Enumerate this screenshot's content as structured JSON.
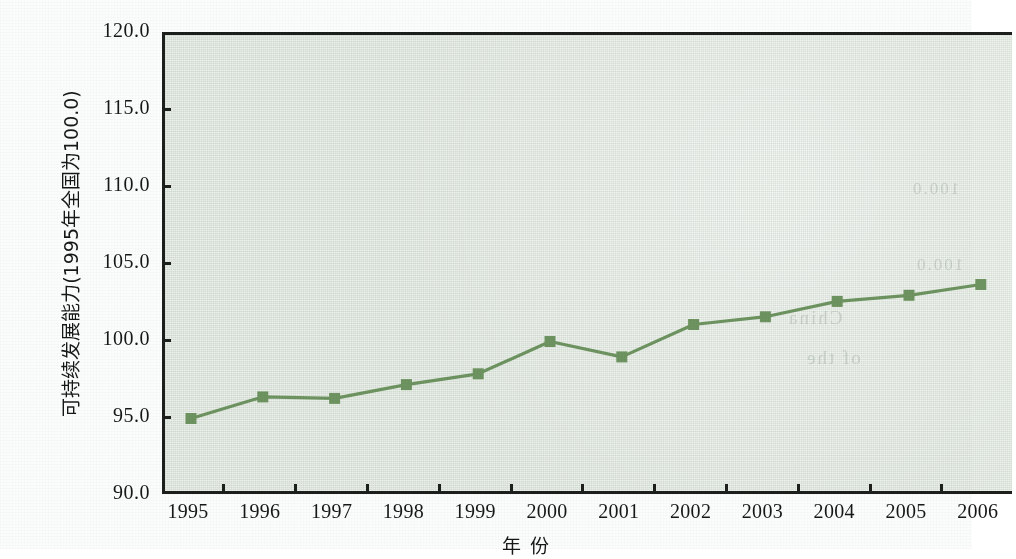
{
  "chart_data": {
    "type": "line",
    "title": "",
    "subtitle": "",
    "xlabel": "年  份",
    "ylabel": "可持续发展能力(1995年全国为100.0)",
    "categories": [
      "1995",
      "1996",
      "1997",
      "1998",
      "1999",
      "2000",
      "2001",
      "2002",
      "2003",
      "2004",
      "2005",
      "2006"
    ],
    "values": [
      95.1,
      96.5,
      96.4,
      97.3,
      98.0,
      100.1,
      99.1,
      101.2,
      101.7,
      102.7,
      103.1,
      103.8
    ],
    "series": [
      {
        "name": "可持续发展能力",
        "values": [
          95.1,
          96.5,
          96.4,
          97.3,
          98.0,
          100.1,
          99.1,
          101.2,
          101.7,
          102.7,
          103.1,
          103.8
        ]
      }
    ],
    "ylim": [
      90.0,
      120.0
    ],
    "ytick_labels": [
      "120.0",
      "115.0",
      "110.0",
      "105.0",
      "100.0",
      "95.0",
      "90.0"
    ],
    "ytick_values": [
      120.0,
      115.0,
      110.0,
      105.0,
      100.0,
      95.0,
      90.0
    ],
    "xtick_labels": [
      "1995",
      "1996",
      "1997",
      "1998",
      "1999",
      "2000",
      "2001",
      "2002",
      "2003",
      "2004",
      "2005",
      "2006"
    ],
    "grid": false,
    "legend": "none",
    "marker": "square",
    "line_color": "#6d9360",
    "marker_color": "#6d9360",
    "plot_background": "#dfe7de",
    "axis_color": "#1d1f1d",
    "page_background": "#fbfcfc"
  },
  "ghost_marks": [
    {
      "text": "100.0",
      "left": 868,
      "top": 160,
      "size": 17
    },
    {
      "text": "100.0",
      "left": 872,
      "top": 236,
      "size": 17
    },
    {
      "text": "China",
      "left": 744,
      "top": 288,
      "size": 19
    },
    {
      "text": "of the",
      "left": 762,
      "top": 328,
      "size": 19
    },
    {
      "text": "Data",
      "left": 756,
      "top": 500,
      "size": 19
    },
    {
      "text": "Green",
      "left": 120,
      "top": 520,
      "size": 19
    }
  ]
}
